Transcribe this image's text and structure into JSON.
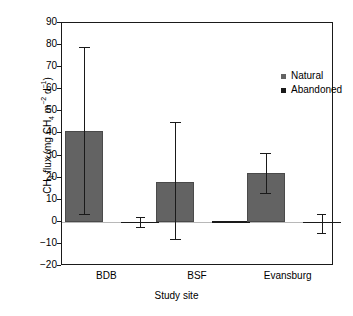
{
  "chart_data": {
    "type": "bar",
    "title": "",
    "xlabel": "Study site",
    "ylabel_plain": "CH4 flux (mg CH4 m-2 d-1)",
    "categories": [
      "BDB",
      "BSF",
      "Evansburg"
    ],
    "series": [
      {
        "name": "Natural",
        "color": "#636363",
        "values": [
          41,
          18,
          22
        ],
        "error_upper": [
          79,
          45,
          31
        ],
        "error_lower": [
          3.5,
          -8,
          13
        ]
      },
      {
        "name": "Abandoned",
        "color": "#1a1a1a",
        "values": [
          -0.2,
          0.2,
          0.1
        ],
        "error_upper": [
          2,
          0.5,
          3.5
        ],
        "error_lower": [
          -2.5,
          -0.2,
          -5
        ]
      }
    ],
    "ylim": [
      -20,
      90
    ],
    "ytick_values": [
      90,
      80,
      70,
      60,
      50,
      40,
      30,
      20,
      10,
      0,
      -10,
      -20
    ],
    "ytick_labels": [
      "90",
      "80",
      "70",
      "60",
      "50",
      "40",
      "30",
      "20",
      "10",
      "0",
      "−10",
      "−20"
    ],
    "grid": false,
    "legend_position": "upper right"
  },
  "axes": {
    "ylabel": {
      "part1": "CH",
      "sub1": "4",
      "part2": " flux (mg CH",
      "sub2": "4",
      "part3": " m",
      "sup1": "−2",
      "part4": " d",
      "sup2": "−1",
      "part5": ")"
    },
    "xlabel": "Study site"
  },
  "legend": {
    "items": [
      {
        "label": "Natural",
        "color": "#636363"
      },
      {
        "label": "Abandoned",
        "color": "#1a1a1a"
      }
    ]
  }
}
